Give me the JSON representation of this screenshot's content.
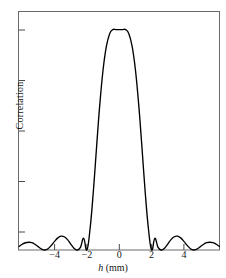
{
  "figure": {
    "background": "#ffffff",
    "line_color": "#000000",
    "axis_color": "#5a5a5a"
  },
  "axes": {
    "x_axis_label_prefix": "h",
    "x_axis_label_units": " (mm)",
    "y_axis_label": "Correlation"
  },
  "chart_data": {
    "type": "line",
    "title": "",
    "xlabel": "h (mm)",
    "ylabel": "Correlation",
    "xlim": [
      -6.2,
      6.2
    ],
    "ylim": [
      0,
      1.08
    ],
    "grid": false,
    "legend": null,
    "x_ticks": [
      -4,
      -2,
      0,
      2,
      4
    ],
    "x_tick_labels": [
      "−4",
      "−2",
      "0",
      "2",
      "4"
    ],
    "y_ticks_count": 5,
    "y_tick_labels": [
      "",
      "",
      "",
      "",
      ""
    ],
    "series": [
      {
        "name": "Correlation",
        "x": [
          -6.2,
          -6.0,
          -5.8,
          -5.6,
          -5.4,
          -5.2,
          -5.0,
          -4.8,
          -4.6,
          -4.4,
          -4.2,
          -4.0,
          -3.8,
          -3.6,
          -3.4,
          -3.2,
          -3.0,
          -2.8,
          -2.6,
          -2.4,
          -2.2,
          -2.0,
          -1.8,
          -1.6,
          -1.4,
          -1.2,
          -1.0,
          -0.8,
          -0.6,
          -0.4,
          -0.2,
          0.0,
          0.2,
          0.4,
          0.6,
          0.8,
          1.0,
          1.2,
          1.4,
          1.6,
          1.8,
          2.0,
          2.2,
          2.4,
          2.6,
          2.8,
          3.0,
          3.2,
          3.4,
          3.6,
          3.8,
          4.0,
          4.2,
          4.4,
          4.6,
          4.8,
          5.0,
          5.2,
          5.4,
          5.6,
          5.8,
          6.0,
          6.2
        ],
        "y": [
          0.016,
          0.026,
          0.033,
          0.035,
          0.033,
          0.025,
          0.014,
          0.004,
          0.0,
          0.006,
          0.021,
          0.039,
          0.055,
          0.063,
          0.06,
          0.047,
          0.027,
          0.008,
          0.0,
          0.012,
          0.053,
          0.0,
          0.1,
          0.268,
          0.47,
          0.663,
          0.818,
          0.923,
          0.98,
          1.0,
          1.0,
          1.0,
          1.0,
          1.0,
          0.98,
          0.923,
          0.818,
          0.663,
          0.47,
          0.268,
          0.1,
          0.0,
          0.053,
          0.012,
          0.0,
          0.008,
          0.027,
          0.047,
          0.06,
          0.063,
          0.055,
          0.039,
          0.021,
          0.006,
          0.0,
          0.004,
          0.014,
          0.025,
          0.033,
          0.035,
          0.033,
          0.026,
          0.016
        ]
      }
    ],
    "annotations": [
      {
        "text": "peak",
        "x": 0,
        "y": 1.0
      },
      {
        "text": "first zero",
        "x": -2,
        "y": 0
      },
      {
        "text": "first zero",
        "x": 2,
        "y": 0
      }
    ]
  }
}
